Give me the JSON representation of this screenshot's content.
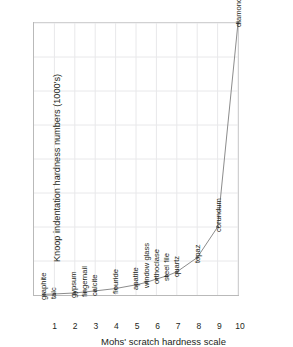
{
  "chart_data": {
    "type": "line",
    "title": "",
    "xlabel": "Mohs' scratch hardness scale",
    "ylabel": "Knoop indentation hardness numbers (1000's)",
    "xlim": [
      0,
      10
    ],
    "ylim": [
      0,
      8
    ],
    "xticks": [
      "1",
      "2",
      "3",
      "4",
      "5",
      "6",
      "7",
      "8",
      "9",
      "10"
    ],
    "yticks": [
      "1",
      "2",
      "3",
      "4",
      "5",
      "6",
      "7",
      "8"
    ],
    "grid": true,
    "legend": "none",
    "marker": "circle",
    "line_color": "#8c8c8c",
    "marker_color": "#7a7a7a",
    "grid_color": "#e8e8ea",
    "axis_color": "#b9b9b9",
    "x": [
      0.5,
      1,
      2,
      2.5,
      3,
      4,
      5,
      5.5,
      6,
      6.5,
      7,
      8,
      9,
      10
    ],
    "y": [
      0.02,
      0.03,
      0.06,
      0.09,
      0.12,
      0.19,
      0.3,
      0.37,
      0.47,
      0.56,
      0.68,
      1.1,
      2.0,
      8.0
    ],
    "labels": [
      "graphite",
      "talc",
      "gypsum",
      "fingernail",
      "calcite",
      "flouride",
      "apatite",
      "window glass",
      "orthoclase",
      "steel file",
      "quartz",
      "topaz",
      "corundum",
      "diamond"
    ],
    "points": [
      {
        "label": "graphite",
        "x": 0.5,
        "y": 0.02
      },
      {
        "label": "talc",
        "x": 1.0,
        "y": 0.03
      },
      {
        "label": "gypsum",
        "x": 2.0,
        "y": 0.06
      },
      {
        "label": "fingernail",
        "x": 2.5,
        "y": 0.09
      },
      {
        "label": "calcite",
        "x": 3.0,
        "y": 0.12
      },
      {
        "label": "flouride",
        "x": 4.0,
        "y": 0.19
      },
      {
        "label": "apatite",
        "x": 5.0,
        "y": 0.3
      },
      {
        "label": "window glass",
        "x": 5.5,
        "y": 0.37
      },
      {
        "label": "orthoclase",
        "x": 6.0,
        "y": 0.47
      },
      {
        "label": "steel file",
        "x": 6.5,
        "y": 0.56
      },
      {
        "label": "quartz",
        "x": 7.0,
        "y": 0.68
      },
      {
        "label": "topaz",
        "x": 8.0,
        "y": 1.1
      },
      {
        "label": "corundum",
        "x": 9.0,
        "y": 2.0
      },
      {
        "label": "diamond",
        "x": 10.0,
        "y": 8.0
      }
    ]
  }
}
